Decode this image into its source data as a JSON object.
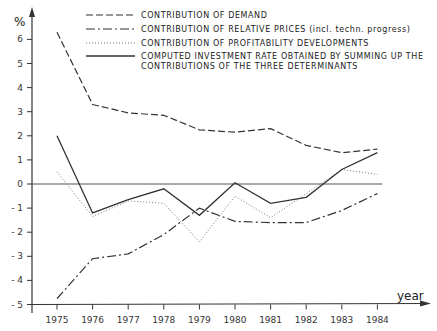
{
  "chart_data": {
    "type": "line",
    "title": "",
    "xlabel": "year",
    "ylabel": "%",
    "ylim": [
      -5,
      6.5
    ],
    "yticks": [
      -5,
      -4,
      -3,
      -2,
      -1,
      0,
      1,
      2,
      3,
      4,
      5,
      6
    ],
    "grid": false,
    "zero_line": true,
    "legend_position": "top-right",
    "x": [
      "1975",
      "1976",
      "1977",
      "1978",
      "1979",
      "1980",
      "1981",
      "1982",
      "1983",
      "1984"
    ],
    "series": [
      {
        "name": "CONTRIBUTION OF DEMAND",
        "style": "dashed",
        "values": [
          6.3,
          3.3,
          2.95,
          2.85,
          2.25,
          2.15,
          2.3,
          1.6,
          1.3,
          1.45
        ]
      },
      {
        "name": "CONTRIBUTION OF RELATIVE PRICES (incl. techn. progress)",
        "style": "dash-dot",
        "values": [
          -4.75,
          -3.1,
          -2.9,
          -2.1,
          -1.0,
          -1.55,
          -1.6,
          -1.6,
          -1.1,
          -0.4
        ]
      },
      {
        "name": "CONTRIBUTION OF PROFITABILITY DEVELOPMENTS",
        "style": "dotted",
        "values": [
          0.5,
          -1.35,
          -0.7,
          -0.8,
          -2.4,
          -0.5,
          -1.4,
          -0.4,
          0.6,
          0.4
        ]
      },
      {
        "name": "COMPUTED INVESTMENT RATE OBTAINED BY SUMMING UP THE CONTRIBUTIONS OF THE THREE DETERMINANTS",
        "style": "solid",
        "values": [
          2.0,
          -1.2,
          -0.65,
          -0.2,
          -1.3,
          0.05,
          -0.8,
          -0.55,
          0.6,
          1.3
        ]
      }
    ]
  },
  "legend": {
    "items": [
      {
        "line1": "CONTRIBUTION OF DEMAND",
        "line2": ""
      },
      {
        "line1": "CONTRIBUTION OF RELATIVE PRICES (incl. techn. progress)",
        "line2": ""
      },
      {
        "line1": "CONTRIBUTION OF PROFITABILITY DEVELOPMENTS",
        "line2": ""
      },
      {
        "line1": "COMPUTED INVESTMENT RATE OBTAINED BY SUMMING UP THE",
        "line2": "CONTRIBUTIONS OF THE THREE DETERMINANTS"
      }
    ]
  },
  "axis": {
    "y_unit": "%",
    "x_label": "year"
  }
}
